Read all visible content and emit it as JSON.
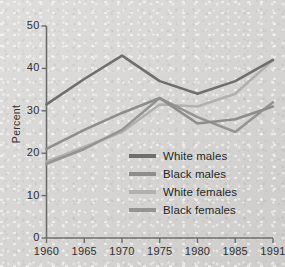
{
  "chart_data": {
    "type": "line",
    "title": "",
    "xlabel": "",
    "ylabel": "Percent",
    "x": [
      1960,
      1965,
      1970,
      1975,
      1980,
      1985,
      1991
    ],
    "xtick_labels": [
      "1960",
      "1965",
      "1970",
      "1975",
      "1980",
      "1985",
      "1991"
    ],
    "ytick_labels": [
      "0",
      "10",
      "20",
      "30",
      "40",
      "50"
    ],
    "yticks": [
      0,
      10,
      20,
      30,
      40,
      50
    ],
    "ylim": [
      0,
      50
    ],
    "grid": false,
    "legend_position": "center",
    "series": [
      {
        "name": "White males",
        "color": "#6e6e6e",
        "values": [
          31.5,
          37.5,
          43.0,
          37.0,
          34.0,
          37.0,
          42.0
        ]
      },
      {
        "name": "Black males",
        "color": "#8d8d8d",
        "values": [
          21.0,
          25.5,
          29.5,
          33.0,
          27.0,
          28.0,
          31.0
        ]
      },
      {
        "name": "White females",
        "color": "#b0b0b0",
        "values": [
          18.0,
          21.5,
          25.0,
          31.5,
          31.0,
          34.0,
          42.0
        ]
      },
      {
        "name": "Black females",
        "color": "#949494",
        "values": [
          17.5,
          21.0,
          25.5,
          33.0,
          28.5,
          25.0,
          32.0
        ]
      }
    ]
  },
  "legend": {
    "items": [
      {
        "label": "White males"
      },
      {
        "label": "Black males"
      },
      {
        "label": "White females"
      },
      {
        "label": "Black females"
      }
    ]
  },
  "axes": {
    "y_title": "Percent",
    "y_labels": [
      "50",
      "40",
      "30",
      "20",
      "10",
      "0"
    ],
    "x_labels": [
      "1960",
      "1965",
      "1970",
      "1975",
      "1980",
      "1985",
      "1991"
    ]
  },
  "style": {
    "axis_color": "#6b6b6b",
    "text_color": "#2f2f2f",
    "background": "#d4d3d1"
  }
}
